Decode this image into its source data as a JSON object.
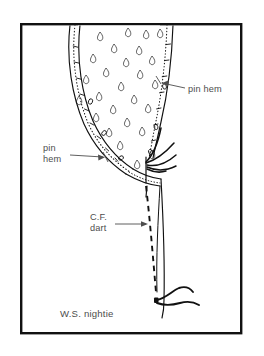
{
  "figure": {
    "kind": "sewing-pattern-diagram",
    "background_color": "#ffffff",
    "ink_color": "#111111",
    "text_color": "#4d4d4d",
    "frame": {
      "name": "diagram-border",
      "x": 20,
      "y": 23,
      "width": 222,
      "height": 311,
      "stroke_color": "#111111",
      "stroke_width": 2.4
    },
    "labels": [
      {
        "id": "pin-hem-right",
        "lines": [
          "pin hem"
        ],
        "x": 188,
        "y": 92,
        "anchor": "start",
        "leader": {
          "from_x": 185,
          "from_y": 89,
          "to_x": 157,
          "to_y": 81,
          "arrow": "to"
        }
      },
      {
        "id": "pin-hem-left",
        "lines": [
          "pin",
          "hem"
        ],
        "x": 43,
        "y": 155,
        "anchor": "start",
        "leader": {
          "from_x": 70,
          "from_y": 157,
          "to_x": 104,
          "to_y": 159,
          "arrow": "to"
        }
      },
      {
        "id": "cf-dart",
        "lines": [
          "C.F.",
          "dart"
        ],
        "x": 90,
        "y": 221,
        "anchor": "start",
        "leader": {
          "from_x": 116,
          "from_y": 224,
          "to_x": 152,
          "to_y": 224,
          "arrow": "to"
        }
      }
    ],
    "caption": {
      "id": "figure-caption",
      "text": "W.S. nightie",
      "x": 60,
      "y": 317
    },
    "strokes": {
      "garment_outer_left": "solid",
      "garment_fold_left": "solid",
      "pin_line_left": "dotted",
      "garment_outer_right": "solid",
      "pin_line_right": "dotted",
      "cf_dart_line": "dashed",
      "panel_edge": "solid"
    },
    "motif": {
      "name": "teardrop-print",
      "count": 26,
      "description": "small teardrop paisley motifs scattered on fabric"
    },
    "threads": {
      "name": "thread-squiggles",
      "clusters": 2,
      "locations": [
        "hem-junction",
        "dart-point-bottom"
      ]
    }
  }
}
